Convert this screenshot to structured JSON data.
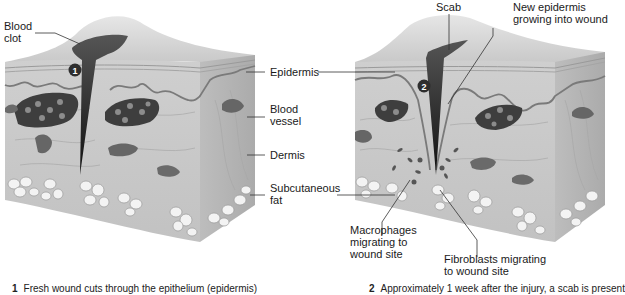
{
  "figure": {
    "panels": [
      {
        "step": "1",
        "caption_number": "1",
        "caption": "Fresh wound cuts through the epithelium (epidermis)"
      },
      {
        "step": "2",
        "caption_number": "2",
        "caption": "Approximately 1 week after the injury, a scab is present"
      }
    ],
    "labels": {
      "blood_clot_1": "Blood",
      "blood_clot_2": "clot",
      "epidermis": "Epidermis",
      "blood_vessel_1": "Blood",
      "blood_vessel_2": "vessel",
      "dermis": "Dermis",
      "subcutaneous_fat_1": "Subcutaneous",
      "subcutaneous_fat_2": "fat",
      "scab": "Scab",
      "new_epidermis_1": "New epidermis",
      "new_epidermis_2": "growing into wound",
      "macrophages_1": "Macrophages",
      "macrophages_2": "migrating to",
      "macrophages_3": "wound site",
      "fibroblasts_1": "Fibroblasts migrating",
      "fibroblasts_2": "to wound site"
    },
    "colors": {
      "skin_face": "#c9c9c9",
      "skin_top": "#dcdcdc",
      "skin_side": "#b9b9b9",
      "epidermis_line": "#7a7a7a",
      "wound": "#3a3a3a",
      "vessel": "#4a4a4a",
      "fat": "#f2f2f2"
    }
  }
}
